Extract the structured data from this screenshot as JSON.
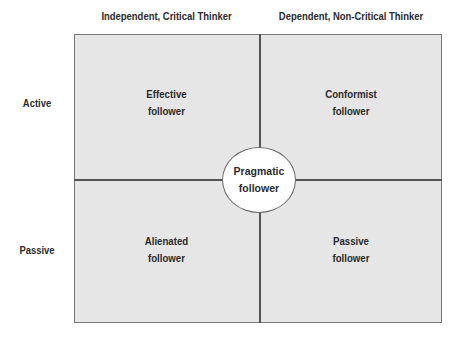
{
  "columns": [
    "Independent, Critical Thinker",
    "Dependent, Non-Critical Thinker"
  ],
  "rows": [
    "Active",
    "Passive"
  ],
  "quadrants": {
    "top_left": {
      "line1": "Effective",
      "line2": "follower"
    },
    "top_right": {
      "line1": "Conformist",
      "line2": "follower"
    },
    "bottom_left": {
      "line1": "Alienated",
      "line2": "follower"
    },
    "bottom_right": {
      "line1": "Passive",
      "line2": "follower"
    }
  },
  "center": {
    "line1": "Pragmatic",
    "line2": "follower"
  },
  "colors": {
    "quadrant_fill": "#e6e6e6",
    "border": "#555555",
    "circle_fill": "#ffffff"
  }
}
